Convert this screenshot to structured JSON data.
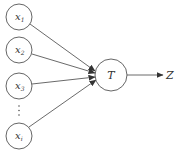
{
  "diagram": {
    "type": "neuron-model",
    "inputs": [
      {
        "var": "x",
        "sub": "1",
        "cx": 19,
        "cy": 17
      },
      {
        "var": "x",
        "sub": "2",
        "cx": 19,
        "cy": 50
      },
      {
        "var": "x",
        "sub": "3",
        "cx": 19,
        "cy": 86
      },
      {
        "var": "x",
        "sub": "i",
        "cx": 19,
        "cy": 136
      }
    ],
    "ellipsis": "⋮",
    "unit": {
      "label": "T",
      "cx": 111,
      "cy": 75
    },
    "output": {
      "label": "Z"
    },
    "colors": {
      "stroke": "#555555",
      "text": "#333333",
      "background": "#ffffff"
    }
  }
}
